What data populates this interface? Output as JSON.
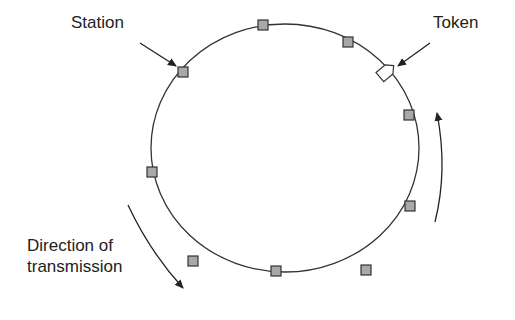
{
  "diagram": {
    "labels": {
      "station": "Station",
      "token": "Token",
      "direction_line1": "Direction of",
      "direction_line2": "transmission"
    },
    "ring": {
      "cx": 285,
      "cy": 148,
      "rx": 134,
      "ry": 124,
      "stroke": "#333333"
    },
    "stations": [
      {
        "x": 263,
        "y": 25
      },
      {
        "x": 348,
        "y": 42
      },
      {
        "x": 183,
        "y": 72
      },
      {
        "x": 409,
        "y": 115
      },
      {
        "x": 152,
        "y": 172
      },
      {
        "x": 410,
        "y": 206
      },
      {
        "x": 193,
        "y": 261
      },
      {
        "x": 366,
        "y": 270
      },
      {
        "x": 276,
        "y": 271
      }
    ],
    "station_fill": "#a8a8a8",
    "token": {
      "x": 386,
      "y": 72
    }
  }
}
